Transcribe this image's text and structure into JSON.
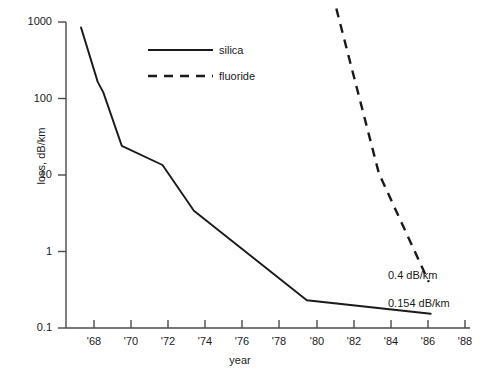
{
  "chart_data": {
    "type": "line",
    "title": "",
    "subtitle": "",
    "xlabel": "year",
    "ylabel": "loss, dB/km",
    "yscale": "log",
    "xlim": [
      1966.6,
      1988.6
    ],
    "ylim": [
      0.1,
      1000
    ],
    "grid": false,
    "legend_position": "upper-center",
    "xticks": [
      1968,
      1970,
      1972,
      1974,
      1976,
      1978,
      1980,
      1982,
      1984,
      1986,
      1988
    ],
    "xticklabels": [
      "'68",
      "'70",
      "'72",
      "'74",
      "'76",
      "'78",
      "'80",
      "'82",
      "'84",
      "'86",
      "'88"
    ],
    "yticks": [
      0.1,
      1,
      10,
      100,
      1000
    ],
    "yticklabels": [
      "0.1",
      "1",
      "10",
      "100",
      "1000"
    ],
    "series": [
      {
        "name": "silica",
        "style": "solid",
        "color": "#1a1a1a",
        "x": [
          1967.3,
          1968.2,
          1968.5,
          1969.5,
          1971.7,
          1973.4,
          1979.5,
          1986.2
        ],
        "y": [
          850,
          165,
          120,
          24,
          13.5,
          3.4,
          0.23,
          0.154
        ]
      },
      {
        "name": "fluoride",
        "style": "dashed",
        "color": "#1a1a1a",
        "x": [
          1981.1,
          1983.4,
          1986.1
        ],
        "y": [
          1500,
          10.5,
          0.4
        ]
      }
    ],
    "annotations": [
      {
        "text": "0.4 dB/km",
        "series": "fluoride",
        "x": 1984.9,
        "y": 0.42
      },
      {
        "text": "0.154 dB/km",
        "series": "silica",
        "x": 1983.0,
        "y": 0.3
      }
    ]
  },
  "axis": {
    "ylabel": "loss, dB/km",
    "xlabel": "year",
    "yticklabels": [
      "1000",
      "100",
      "10",
      "1",
      "0.1"
    ],
    "xticklabels": [
      "'68",
      "'70",
      "'72",
      "'74",
      "'76",
      "'78",
      "'80",
      "'82",
      "'84",
      "'86",
      "'88"
    ]
  },
  "legend": {
    "items": [
      {
        "label": "silica",
        "style": "solid"
      },
      {
        "label": "fluoride",
        "style": "dashed"
      }
    ]
  },
  "annotations": {
    "fluoride_value": "0.4 dB/km",
    "silica_value": "0.154 dB/km"
  },
  "colors": {
    "line": "#1a1a1a",
    "axis": "#4a4a4a",
    "background": "#ffffff"
  }
}
